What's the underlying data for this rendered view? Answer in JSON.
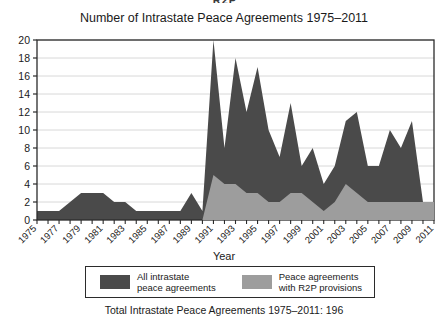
{
  "header_partial": "R2P",
  "chart_title": "Number of Intrastate Peace Agreements 1975–2011",
  "xaxis_label": "Year",
  "footer_caption": "Total Intrastate Peace Agreements 1975–2011: 196",
  "legend": {
    "items": [
      {
        "label_line1": "All intrastate",
        "label_line2": "peace agreements",
        "color": "#4a4a4a"
      },
      {
        "label_line1": "Peace agreements",
        "label_line2": "with R2P provisions",
        "color": "#9d9d9d"
      }
    ]
  },
  "colors": {
    "dark_series": "#4a4a4a",
    "light_series": "#9d9d9d",
    "axis": "#2b2b2b",
    "grid": "#d8d8d8",
    "background": "#ffffff"
  },
  "chart_data": {
    "type": "area",
    "title": "Number of Intrastate Peace Agreements 1975–2011",
    "xlabel": "Year",
    "ylabel": "",
    "ylim": [
      0,
      20
    ],
    "ytick_step": 2,
    "yticks": [
      0,
      2,
      4,
      6,
      8,
      10,
      12,
      14,
      16,
      18,
      20
    ],
    "xlim": [
      1975,
      2011
    ],
    "xticks": [
      1975,
      1977,
      1979,
      1981,
      1983,
      1985,
      1987,
      1989,
      1991,
      1993,
      1995,
      1997,
      1999,
      2001,
      2003,
      2005,
      2007,
      2009,
      2011
    ],
    "xtick_labels": [
      "1975",
      "1977",
      "1979",
      "1981",
      "1983",
      "1985",
      "1987",
      "1989",
      "1991",
      "1993",
      "1995",
      "1997",
      "1999",
      "2001",
      "2003",
      "2005",
      "2007",
      "2009",
      "2011"
    ],
    "grid": true,
    "legend_position": "below",
    "x": [
      1975,
      1976,
      1977,
      1978,
      1979,
      1980,
      1981,
      1982,
      1983,
      1984,
      1985,
      1986,
      1987,
      1988,
      1989,
      1990,
      1991,
      1992,
      1993,
      1994,
      1995,
      1996,
      1997,
      1998,
      1999,
      2000,
      2001,
      2002,
      2003,
      2004,
      2005,
      2006,
      2007,
      2008,
      2009,
      2010,
      2011
    ],
    "series": [
      {
        "name": "All intrastate peace agreements",
        "color": "#4a4a4a",
        "values": [
          1,
          1,
          1,
          2,
          3,
          3,
          3,
          2,
          2,
          1,
          1,
          1,
          1,
          1,
          3,
          1,
          20,
          8,
          18,
          12,
          17,
          10,
          7,
          13,
          6,
          8,
          4,
          6,
          11,
          12,
          6,
          6,
          10,
          8,
          11,
          2,
          2
        ]
      },
      {
        "name": "Peace agreements with R2P provisions",
        "color": "#9d9d9d",
        "values": [
          0,
          0,
          0,
          0,
          0,
          0,
          0,
          0,
          0,
          0,
          0,
          0,
          0,
          0,
          0,
          0,
          5,
          4,
          4,
          3,
          3,
          2,
          2,
          3,
          3,
          2,
          1,
          2,
          4,
          3,
          2,
          2,
          2,
          2,
          2,
          2,
          2
        ]
      }
    ],
    "total_annotation": "Total Intrastate Peace Agreements 1975–2011: 196"
  }
}
